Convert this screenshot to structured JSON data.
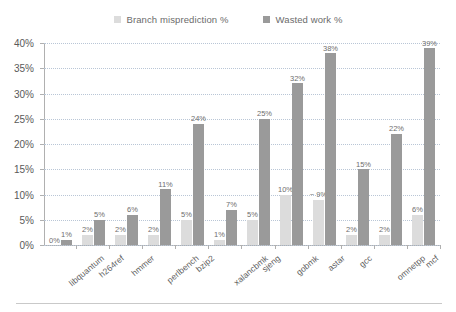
{
  "chart_data": {
    "type": "bar",
    "title": "",
    "subtitle": "",
    "xlabel": "",
    "ylabel": "",
    "ylim": [
      0,
      40
    ],
    "ytick_labels": [
      "0%",
      "5%",
      "10%",
      "15%",
      "20%",
      "25%",
      "30%",
      "35%",
      "40%"
    ],
    "ytick_values": [
      0,
      5,
      10,
      15,
      20,
      25,
      30,
      35,
      40
    ],
    "grid": true,
    "legend_position": "top-center",
    "categories": [
      "libquantum",
      "h264ref",
      "hmmer",
      "perlbench",
      "bzip2",
      "xalancbmk",
      "sjeng",
      "gobmk",
      "astar",
      "gcc",
      "omnetpp",
      "mcf"
    ],
    "series": [
      {
        "name": "Branch misprediction %",
        "color": "#dcdcdc",
        "values": [
          0,
          2,
          2,
          2,
          5,
          1,
          5,
          10,
          9,
          2,
          2,
          6
        ],
        "labels": [
          "0%",
          "2%",
          "2%",
          "2%",
          "5%",
          "1%",
          "5%",
          "10%",
          "~ 9%",
          "2%",
          "2%",
          "6%"
        ]
      },
      {
        "name": "Wasted work %",
        "color": "#9a9a9a",
        "values": [
          1,
          5,
          6,
          11,
          24,
          7,
          25,
          32,
          38,
          15,
          22,
          39
        ],
        "labels": [
          "1%",
          "5%",
          "6%",
          "11%",
          "24%",
          "7%",
          "25%",
          "32%",
          "38%",
          "15%",
          "22%",
          "39%"
        ]
      }
    ]
  },
  "legend": {
    "items": [
      {
        "label": "Branch misprediction %",
        "color": "#dcdcdc"
      },
      {
        "label": "Wasted work %",
        "color": "#9a9a9a"
      }
    ]
  }
}
